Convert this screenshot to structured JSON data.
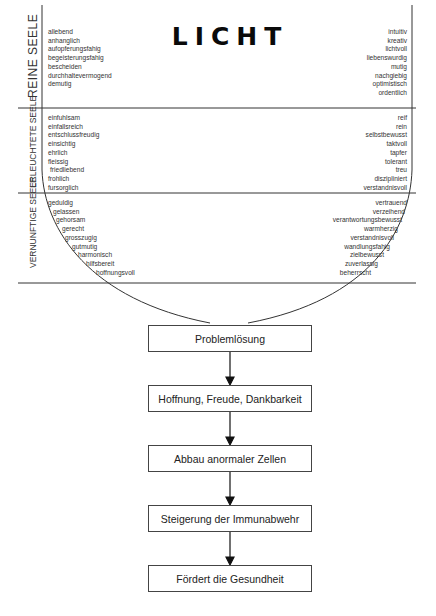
{
  "title": "LICHT",
  "sections": [
    {
      "label": "REINE SEELE",
      "left_items": [
        "allebend",
        "anhanglich",
        "aufopferungsfahig",
        "begeisterungsfahig",
        "bescheiden",
        "durchhaltevermogend",
        "demutig"
      ],
      "right_items": [
        "intuitiv",
        "kreativ",
        "lichtvoll",
        "liebenswurdig",
        "mutig",
        "nachgiebig",
        "optimistisch",
        "ordentlich"
      ]
    },
    {
      "label": "ERLEUCHTETE SEELE",
      "left_items": [
        "einfuhlsam",
        "einfallsreich",
        "entschlussfreudig",
        "einsichtig",
        "ehrlich",
        "fleissig",
        "friedliebend",
        "frohlich",
        "fursorglich"
      ],
      "right_items": [
        "reif",
        "rein",
        "selbstbewusst",
        "taktvoll",
        "tapfer",
        "tolerant",
        "treu",
        "diszipliniert",
        "verstandnisvoll"
      ]
    },
    {
      "label": "VERNUNFTIGE SEELE",
      "left_items": [
        "geduldig",
        "gelassen",
        "gehorsam",
        "gerecht",
        "grosszugig",
        "gutmutig",
        "harmonisch",
        "hilfsbereit",
        "hoffnungsvoll"
      ],
      "right_items": [
        "vertrauend",
        "verzeihend",
        "verantwortungsbewusst",
        "warmherzig",
        "verstandnisvoll",
        "wandlungsfahig",
        "zielbewusst",
        "zuverlassig",
        "beherrscht"
      ]
    }
  ],
  "flow": [
    "Problemlösung",
    "Hoffnung, Freude, Dankbarkeit",
    "Abbau anormaler Zellen",
    "Steigerung der Immunabwehr",
    "Fördert die Gesundheit"
  ]
}
